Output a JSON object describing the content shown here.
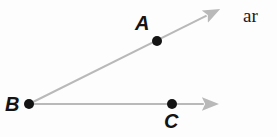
{
  "figure": {
    "name": "angle-abc-diagram",
    "background_color": "#fdfdfd",
    "width": 277,
    "height": 137,
    "ray_color": "#b9b9b9",
    "point_color": "#141414",
    "label_color": "#141414",
    "points": [
      {
        "id": "A",
        "label": "A",
        "x": 157,
        "y": 41,
        "radius": 5,
        "label_x": 135,
        "label_y": 13,
        "label_position": "above-left"
      },
      {
        "id": "B",
        "label": "B",
        "x": 29,
        "y": 104,
        "radius": 5,
        "label_x": 5,
        "label_y": 94,
        "label_position": "left"
      },
      {
        "id": "C",
        "label": "C",
        "x": 172,
        "y": 104,
        "radius": 5,
        "label_x": 164,
        "label_y": 111,
        "label_position": "below"
      }
    ],
    "rays": [
      {
        "id": "ray-BA",
        "from": "B",
        "through": "A",
        "start_x": 29,
        "start_y": 104,
        "end_x": 222,
        "end_y": 8,
        "arrowhead": "end",
        "stroke_width": 2
      },
      {
        "id": "ray-BC",
        "from": "B",
        "through": "C",
        "start_x": 29,
        "start_y": 104,
        "end_x": 221,
        "end_y": 104,
        "arrowhead": "end",
        "stroke_width": 2
      }
    ]
  },
  "side_text": {
    "fragment": "ar"
  }
}
